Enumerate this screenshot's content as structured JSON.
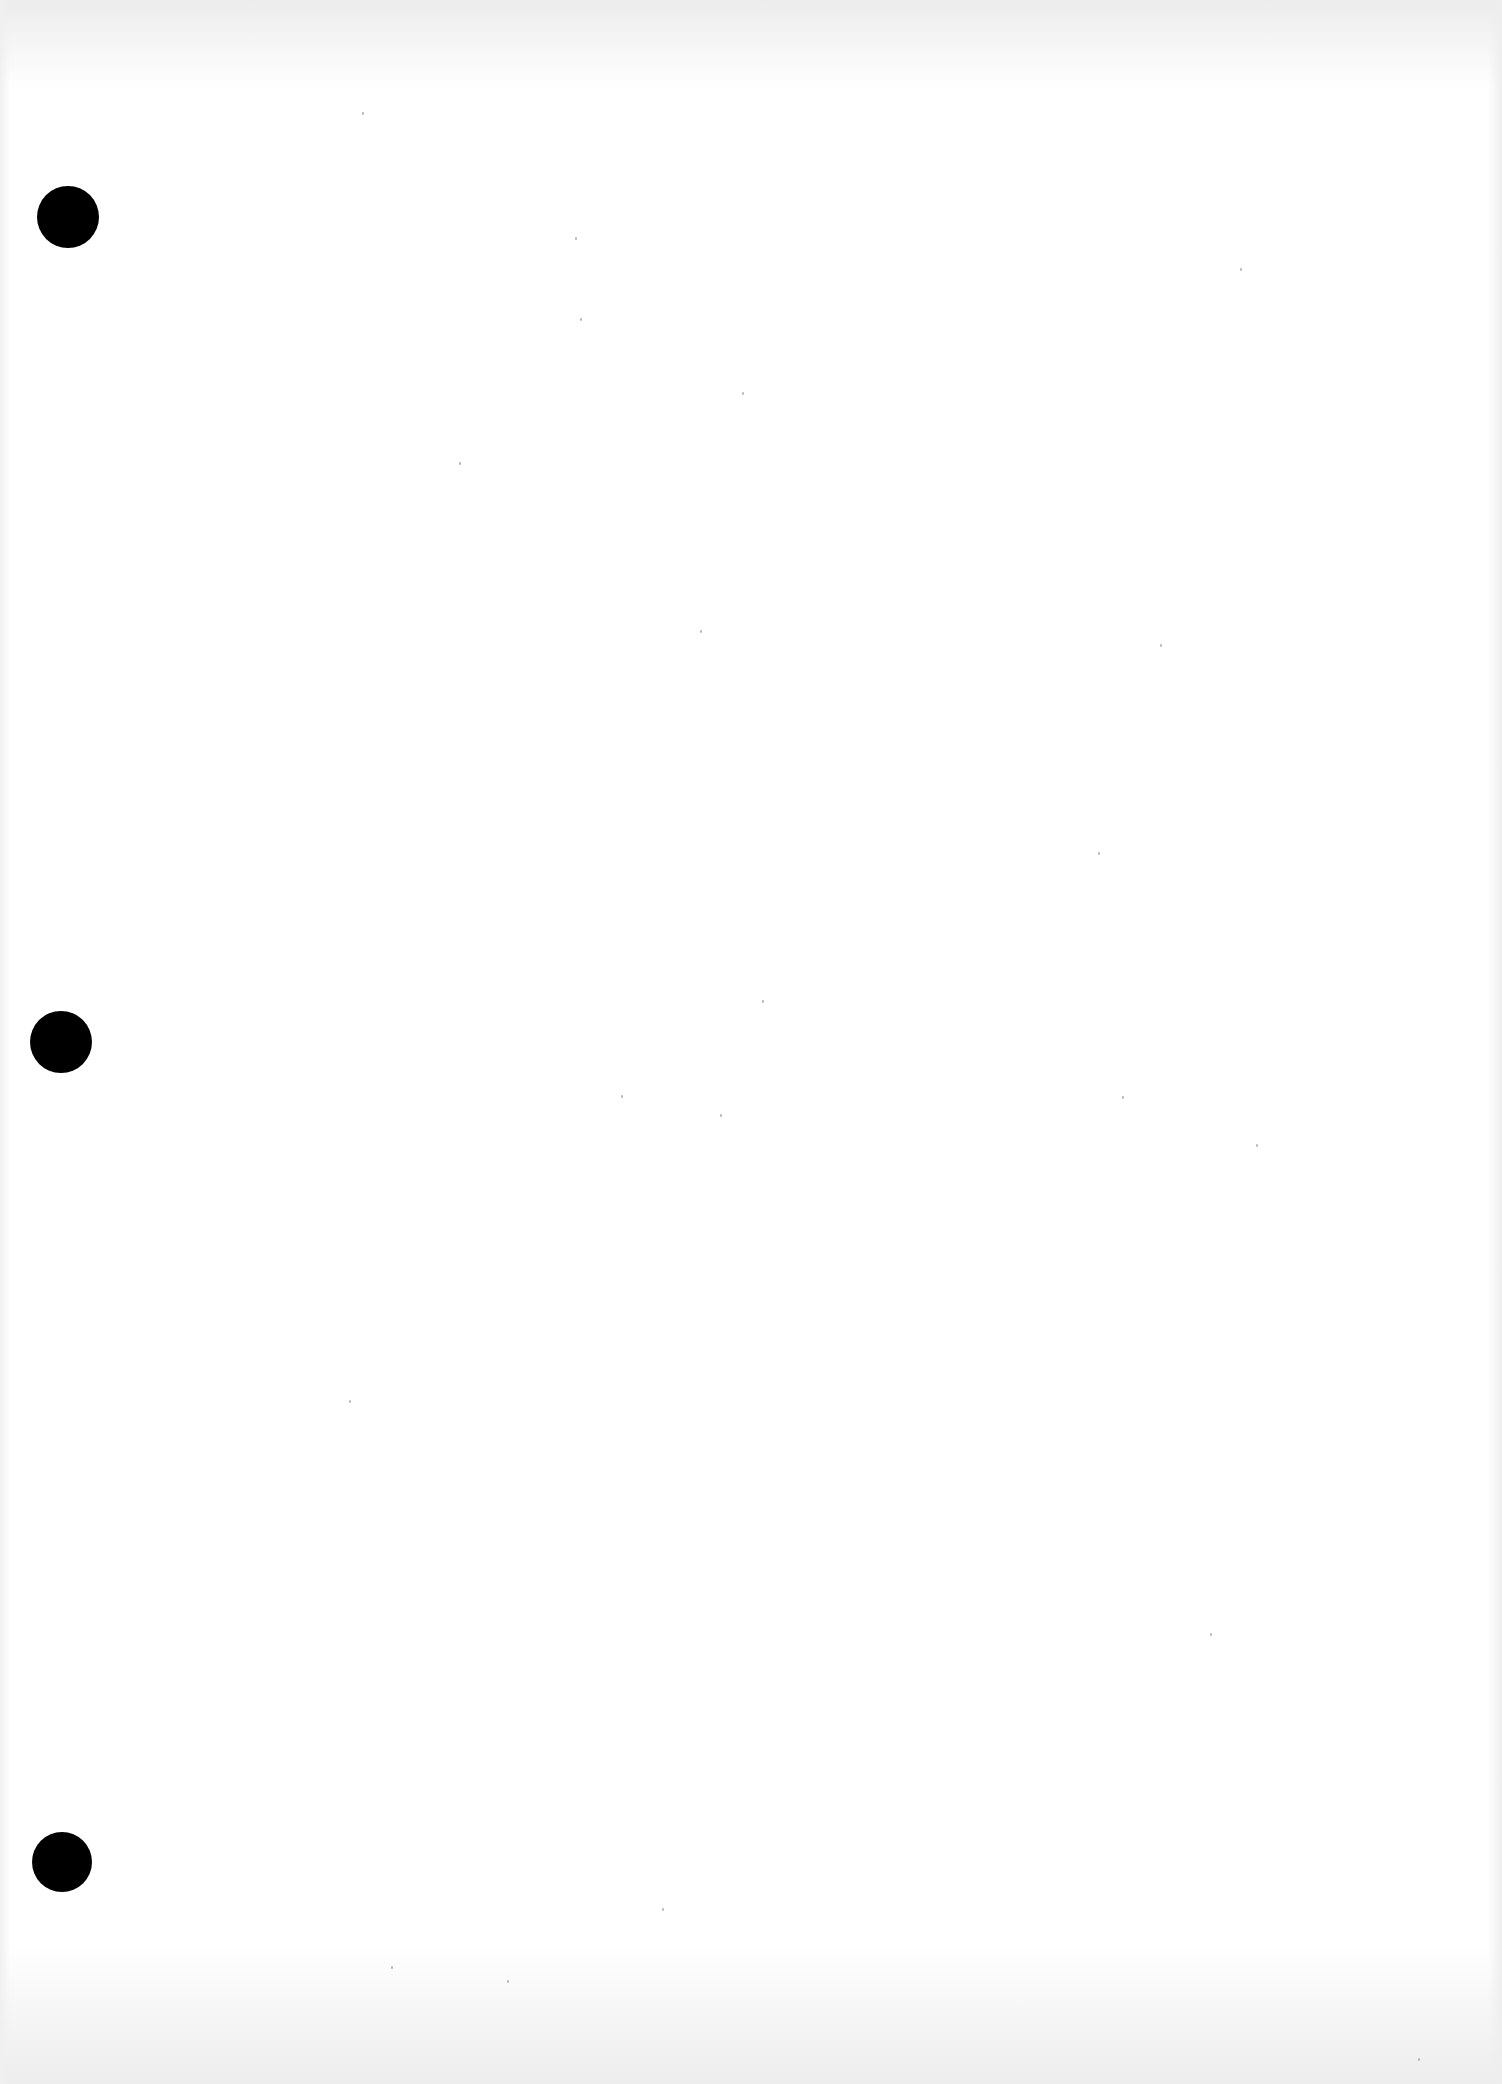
{
  "document": {
    "type": "blank scanned sheet",
    "text": "",
    "background_color": "#ffffff",
    "punch_holes": [
      {
        "name": "top-hole",
        "cx": 68,
        "cy": 217,
        "d": 62,
        "color": "#000000"
      },
      {
        "name": "middle-hole",
        "cx": 61,
        "cy": 1042,
        "d": 62,
        "color": "#000000"
      },
      {
        "name": "bottom-hole",
        "cx": 62,
        "cy": 1862,
        "d": 60,
        "color": "#000000"
      }
    ]
  }
}
